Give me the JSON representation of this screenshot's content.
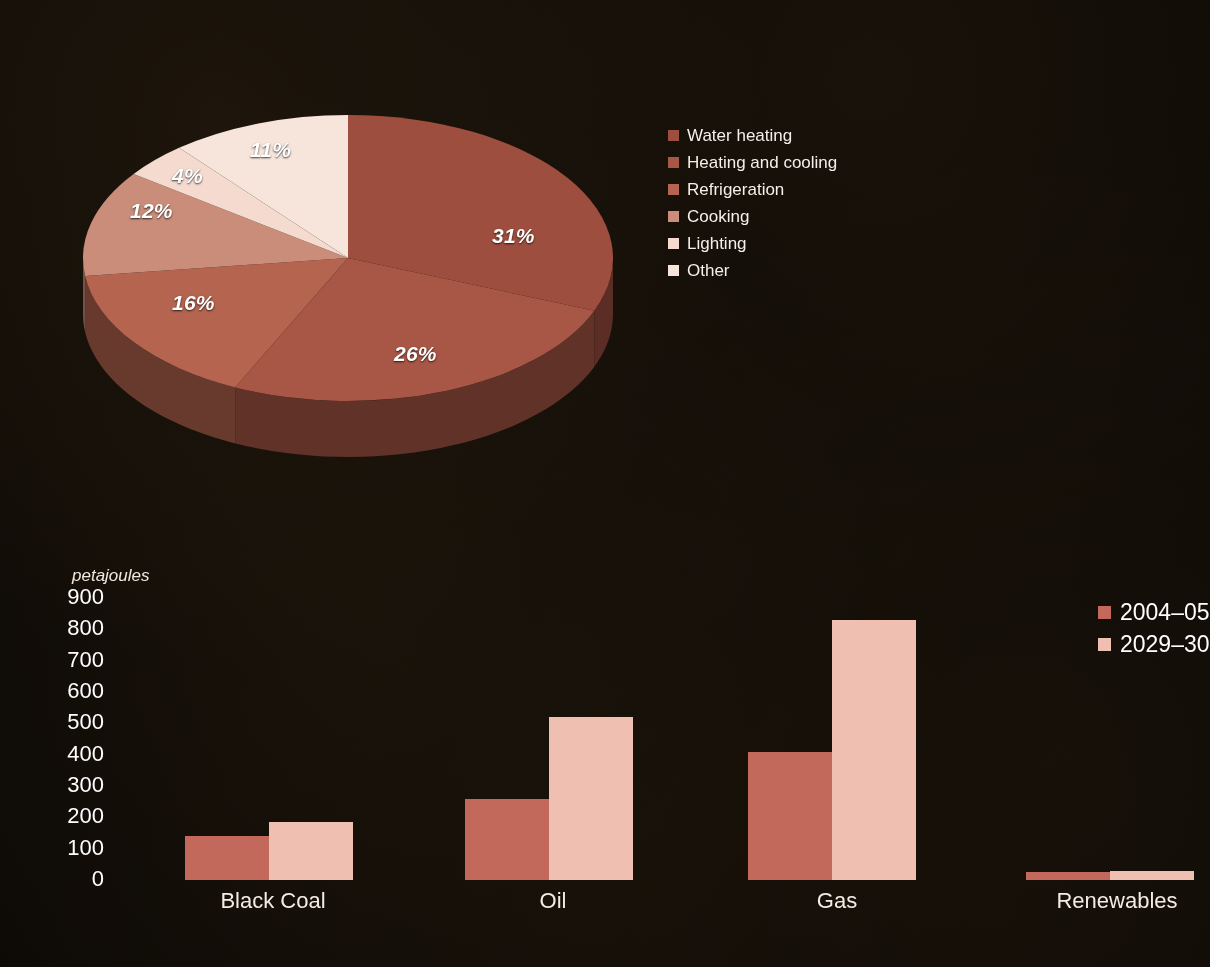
{
  "chart_data": [
    {
      "type": "pie",
      "title": "",
      "legend_position": "right",
      "categories": [
        "Water heating",
        "Heating and cooling",
        "Refrigeration",
        "Cooking",
        "Lighting",
        "Other"
      ],
      "values": [
        31,
        26,
        16,
        12,
        4,
        11
      ],
      "value_labels": [
        "31%",
        "26%",
        "16%",
        "12%",
        "4%",
        "11%"
      ],
      "colors": [
        "#9e4e3e",
        "#a85645",
        "#b4644f",
        "#c98d7a",
        "#f5dacf",
        "#f7e4da"
      ],
      "units": "percent",
      "three_d": true
    },
    {
      "type": "bar",
      "title": "",
      "xlabel": "",
      "ylabel": "petajoules",
      "ylim": [
        0,
        900
      ],
      "yticks": [
        900,
        800,
        700,
        600,
        500,
        400,
        300,
        200,
        100,
        0
      ],
      "grid": false,
      "legend_position": "right",
      "categories": [
        "Black Coal",
        "Oil",
        "Gas",
        "Renewables"
      ],
      "series": [
        {
          "name": "2004–05",
          "color": "#c2695c",
          "values": [
            140,
            260,
            410,
            25
          ]
        },
        {
          "name": "2029–30",
          "color": "#efc0b2",
          "values": [
            185,
            520,
            830,
            30
          ]
        }
      ]
    }
  ],
  "pie": {
    "slices": [
      {
        "label": "Water heating",
        "pct": "31%",
        "color": "#9e4e3e",
        "lx": 492,
        "ly": 224,
        "value": 31
      },
      {
        "label": "Heating and cooling",
        "pct": "26%",
        "color": "#a85645",
        "lx": 394,
        "ly": 342,
        "value": 26
      },
      {
        "label": "Refrigeration",
        "pct": "16%",
        "color": "#b4644f",
        "lx": 172,
        "ly": 291,
        "value": 16
      },
      {
        "label": "Cooking",
        "pct": "12%",
        "color": "#c98d7a",
        "lx": 130,
        "ly": 199,
        "value": 12
      },
      {
        "label": "Lighting",
        "pct": "4%",
        "color": "#f5dacf",
        "lx": 172,
        "ly": 164,
        "value": 4
      },
      {
        "label": "Other",
        "pct": "11%",
        "color": "#f7e4da",
        "lx": 250,
        "ly": 138,
        "value": 11
      }
    ]
  },
  "bar": {
    "y_unit": "petajoules",
    "yticks": [
      "900",
      "800",
      "700",
      "600",
      "500",
      "400",
      "300",
      "200",
      "100",
      "0"
    ],
    "categories": [
      "Black Coal",
      "Oil",
      "Gas",
      "Renewables"
    ],
    "legend": [
      {
        "label": "2004–05",
        "color": "#c2695c"
      },
      {
        "label": "2029–30",
        "color": "#efc0b2"
      }
    ],
    "groups": [
      {
        "name": "Black Coal",
        "a": 140,
        "b": 185,
        "left": 45,
        "label_left": 188,
        "label_w": 170
      },
      {
        "name": "Oil",
        "a": 260,
        "b": 520,
        "left": 325,
        "label_left": 468,
        "label_w": 170
      },
      {
        "name": "Gas",
        "a": 410,
        "b": 830,
        "left": 608,
        "label_left": 752,
        "label_w": 170
      },
      {
        "name": "Renewables",
        "a": 25,
        "b": 30,
        "left": 886,
        "label_left": 1028,
        "label_w": 178
      }
    ]
  }
}
